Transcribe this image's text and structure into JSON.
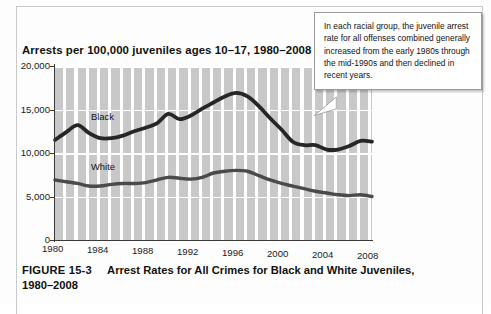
{
  "figure": {
    "number": "FIGURE 15-3",
    "caption_line1": "Arrest Rates for All Crimes for Black and White Juveniles,",
    "caption_line2": "1980–2008"
  },
  "callout": {
    "text": "In each racial group, the juvenile arrest rate for all offenses combined generally increased from the early 1980s through the mid-1990s and then declined in recent years."
  },
  "chart_data": {
    "type": "line",
    "title": "Arrests per 100,000 juveniles ages 10–17, 1980–2008",
    "xlabel": "",
    "ylabel": "",
    "grid": true,
    "legend": "inline-labels",
    "xlim": [
      1980,
      2008
    ],
    "ylim": [
      0,
      20000
    ],
    "ytick_labels": [
      "20,000",
      "15,000",
      "10,000",
      "5,000",
      "0"
    ],
    "ytick_values": [
      20000,
      15000,
      10000,
      5000,
      0
    ],
    "xtick_labels": [
      "1980",
      "1984",
      "1988",
      "1992",
      "1996",
      "2000",
      "2004",
      "2008"
    ],
    "xtick_values": [
      1980,
      1984,
      1988,
      1992,
      1996,
      2000,
      2004,
      2008
    ],
    "x": [
      1980,
      1981,
      1982,
      1983,
      1984,
      1985,
      1986,
      1987,
      1988,
      1989,
      1990,
      1991,
      1992,
      1993,
      1994,
      1995,
      1996,
      1997,
      1998,
      1999,
      2000,
      2001,
      2002,
      2003,
      2004,
      2005,
      2006,
      2007,
      2008
    ],
    "series": [
      {
        "name": "Black",
        "color": "#262626",
        "values": [
          11500,
          12400,
          13200,
          12300,
          11700,
          11700,
          12000,
          12500,
          12900,
          13400,
          14500,
          13900,
          14300,
          15100,
          15800,
          16500,
          16900,
          16500,
          15400,
          14000,
          12700,
          11300,
          10900,
          10900,
          10400,
          10400,
          10800,
          11400,
          11300
        ]
      },
      {
        "name": "White",
        "color": "#4a4a4a",
        "values": [
          6900,
          6700,
          6500,
          6200,
          6200,
          6400,
          6500,
          6500,
          6600,
          6900,
          7200,
          7100,
          7000,
          7200,
          7700,
          7900,
          8000,
          7900,
          7400,
          6900,
          6500,
          6200,
          5900,
          5600,
          5400,
          5200,
          5100,
          5200,
          5000
        ]
      }
    ],
    "annotations": [
      {
        "text": "Black",
        "x": 1983.2,
        "y": 13900
      },
      {
        "text": "White",
        "x": 1983.2,
        "y": 8700
      }
    ]
  }
}
